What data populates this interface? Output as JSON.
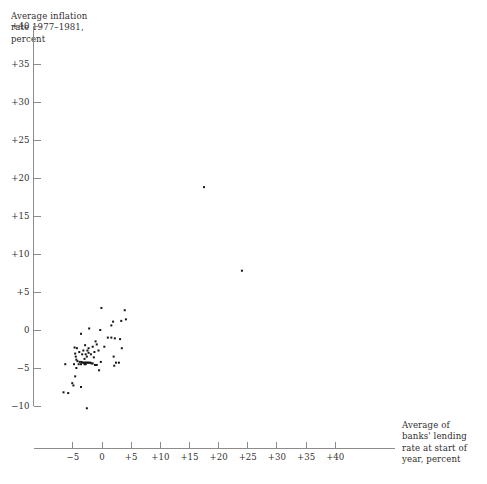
{
  "chart_data": {
    "type": "scatter",
    "title": "",
    "ylabel": "Average inflation\nrate 1977–1981,\npercent",
    "xlabel": "Average of\nbanks' lending\nrate at start of\nyear, percent",
    "xlim": [
      -7.9,
      42.5
    ],
    "ylim": [
      -10.9,
      41.0
    ],
    "grid": false,
    "legend": null,
    "xticks": [
      "−5",
      "0",
      "+5",
      "+10",
      "+15",
      "+20",
      "+25",
      "+30",
      "+35",
      "+40"
    ],
    "xtick_values": [
      -5,
      0,
      5,
      10,
      15,
      20,
      25,
      30,
      35,
      40
    ],
    "yticks": [
      "+40",
      "+35",
      "+30",
      "+25",
      "+20",
      "+15",
      "+10",
      "+5",
      "0",
      "−5",
      "−10"
    ],
    "ytick_values": [
      40,
      35,
      30,
      25,
      20,
      15,
      10,
      5,
      0,
      -5,
      -10
    ],
    "marker": "square",
    "marker_color": "#151515",
    "marker_size_px": 2,
    "n_points": 74,
    "points": [
      [
        17.5,
        18.8
      ],
      [
        24.0,
        7.8
      ],
      [
        -0.1,
        2.9
      ],
      [
        3.9,
        2.6
      ],
      [
        1.9,
        1.1
      ],
      [
        3.3,
        1.2
      ],
      [
        4.1,
        1.4
      ],
      [
        1.6,
        0.6
      ],
      [
        -2.2,
        0.2
      ],
      [
        -0.3,
        0.0
      ],
      [
        -3.6,
        -0.5
      ],
      [
        1.0,
        -1.0
      ],
      [
        1.6,
        -1.0
      ],
      [
        2.2,
        -1.1
      ],
      [
        3.1,
        -1.2
      ],
      [
        -1.1,
        -1.5
      ],
      [
        -0.9,
        -1.9
      ],
      [
        -2.9,
        -2.0
      ],
      [
        -1.6,
        -2.2
      ],
      [
        -4.7,
        -2.3
      ],
      [
        -4.3,
        -2.4
      ],
      [
        -2.3,
        -2.4
      ],
      [
        3.4,
        -2.4
      ],
      [
        -3.2,
        -2.7
      ],
      [
        -2.5,
        -2.7
      ],
      [
        -0.6,
        -2.7
      ],
      [
        -3.9,
        -2.9
      ],
      [
        -1.3,
        -2.9
      ],
      [
        -4.6,
        -3.1
      ],
      [
        -3.4,
        -3.2
      ],
      [
        -2.8,
        -3.2
      ],
      [
        -1.9,
        -3.2
      ],
      [
        -4.5,
        -3.5
      ],
      [
        -2.6,
        -3.5
      ],
      [
        2.0,
        -3.5
      ],
      [
        -4.4,
        -3.9
      ],
      [
        -4.2,
        -4.1
      ],
      [
        -3.8,
        -4.2
      ],
      [
        -3.5,
        -4.2
      ],
      [
        -3.3,
        -4.3
      ],
      [
        -3.1,
        -4.3
      ],
      [
        -2.9,
        -4.3
      ],
      [
        -2.7,
        -4.3
      ],
      [
        -2.6,
        -4.3
      ],
      [
        -2.4,
        -4.3
      ],
      [
        -2.2,
        -4.3
      ],
      [
        -2.0,
        -4.3
      ],
      [
        -1.8,
        -4.4
      ],
      [
        -1.6,
        -4.4
      ],
      [
        -3.0,
        -4.5
      ],
      [
        -2.8,
        -4.5
      ],
      [
        -3.6,
        -4.5
      ],
      [
        -4.0,
        -4.5
      ],
      [
        -4.8,
        -4.5
      ],
      [
        -6.3,
        -4.5
      ],
      [
        -1.2,
        -4.6
      ],
      [
        -0.9,
        -4.6
      ],
      [
        2.4,
        -4.3
      ],
      [
        2.9,
        -4.3
      ],
      [
        2.1,
        -4.7
      ],
      [
        -4.4,
        -5.0
      ],
      [
        -0.5,
        -5.3
      ],
      [
        -4.6,
        -6.1
      ],
      [
        -5.1,
        -7.0
      ],
      [
        -4.9,
        -7.3
      ],
      [
        -3.6,
        -7.5
      ],
      [
        -6.6,
        -8.2
      ],
      [
        -5.8,
        -8.3
      ],
      [
        -2.6,
        -10.3
      ],
      [
        -3.0,
        -3.8
      ],
      [
        -2.3,
        -3.0
      ],
      [
        -1.4,
        -3.6
      ],
      [
        0.4,
        -2.2
      ],
      [
        -0.2,
        -4.2
      ]
    ]
  },
  "axes": {
    "y_axis_name": "inflation-axis",
    "x_axis_name": "lending-rate-axis"
  }
}
